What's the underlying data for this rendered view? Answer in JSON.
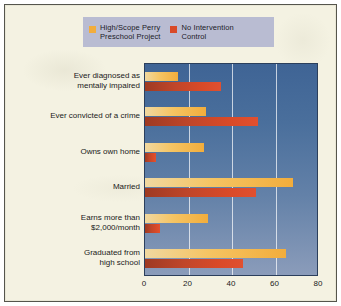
{
  "figure": {
    "background_color": "#f4f2e2",
    "border_color": "#55554c"
  },
  "legend": {
    "background_color": "#b9bcd2",
    "entries": [
      {
        "label": "High/Scope Perry\nPreschool Project",
        "color": "#f2ad3c",
        "swatch_name": "legend-swatch-program"
      },
      {
        "label": "No Intervention\nControl",
        "color": "#d94a28",
        "swatch_name": "legend-swatch-control"
      }
    ]
  },
  "chart_data": {
    "type": "bar",
    "orientation": "horizontal",
    "title": "",
    "xlabel": "",
    "ylabel": "",
    "xlim": [
      0,
      80
    ],
    "xticks": [
      0,
      20,
      40,
      60,
      80
    ],
    "xtick_labels": [
      "0",
      "20",
      "40",
      "60",
      "80"
    ],
    "grid": "vertical gridlines at 20, 40, 60",
    "legend_position": "top",
    "plot_background": "blue vertical gradient (#3f6495 to #8b9cba)",
    "categories": [
      "Ever diagnosed as\nmentally impaired",
      "Ever convicted of a crime",
      "Owns own home",
      "Married",
      "Earns more than\n$2,000/month",
      "Graduated from\nhigh school"
    ],
    "series": [
      {
        "name": "High/Scope Perry Preschool Project",
        "color": "#f2ad3c",
        "values": [
          15,
          28,
          27,
          68,
          29,
          65
        ]
      },
      {
        "name": "No Intervention Control",
        "color": "#d94a28",
        "values": [
          35,
          52,
          5,
          51,
          7,
          45
        ]
      }
    ]
  }
}
